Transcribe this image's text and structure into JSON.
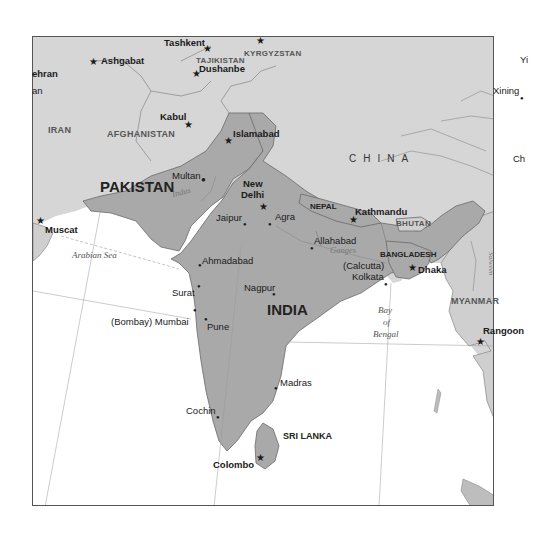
{
  "map": {
    "title": "South Asia reference map",
    "colors": {
      "focus_land": "#a9a9a9",
      "other_land": "#d6d6d6",
      "water": "#ffffff",
      "border": "#6a6a6a",
      "frame": "#555555"
    },
    "countries": {
      "iran": "IRAN",
      "afghanistan": "AFGHANISTAN",
      "pakistan": "PAKISTAN",
      "india": "INDIA",
      "china": "CHINA",
      "nepal": "NEPAL",
      "bhutan": "BHUTAN",
      "bangladesh": "BANGLADESH",
      "myanmar": "MYANMAR",
      "sri_lanka": "SRI LANKA",
      "tajikistan": "TAJIKISTAN",
      "kyrgyzstan": "KYRGYZSTAN"
    },
    "capitals": {
      "tashkent": "Tashkent",
      "ashgabat": "Ashgabat",
      "dushanbe": "Dushanbe",
      "kabul": "Kabul",
      "islamabad": "Islamabad",
      "new_delhi_line1": "New",
      "new_delhi_line2": "Delhi",
      "kathmandu": "Kathmandu",
      "dhaka": "Dhaka",
      "muscat": "Muscat",
      "rangoon": "Rangoon",
      "colombo": "Colombo",
      "tehran_partial": "ehran"
    },
    "cities": {
      "multan": "Multan",
      "jaipur": "Jaipur",
      "agra": "Agra",
      "allahabad": "Allahabad",
      "calcutta": "(Calcutta)",
      "kolkata": "Kolkata",
      "ahmadabad": "Ahmadabad",
      "surat": "Surat",
      "nagpur": "Nagpur",
      "mumbai": "(Bombay) Mumbai",
      "pune": "Pune",
      "madras": "Madras",
      "cochin": "Cochin",
      "xining": "Xining"
    },
    "partial_labels": {
      "left_an": "an",
      "right_yi": "Yi",
      "right_ch": "Ch",
      "right_m": "M"
    },
    "water_bodies": {
      "arabian_sea": "Arabian Sea",
      "bay_line1": "Bay",
      "bay_line2": "of",
      "bay_line3": "Bengal"
    },
    "rivers": {
      "indus": "Indus",
      "ganges": "Ganges",
      "salween": "Salween"
    }
  }
}
